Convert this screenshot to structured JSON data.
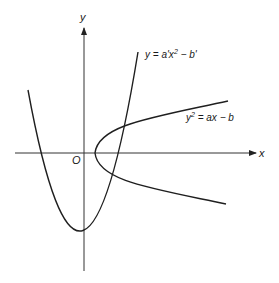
{
  "diagram": {
    "type": "coordinate-plot",
    "axes": {
      "x_label": "x",
      "y_label": "y",
      "origin_label": "O"
    },
    "curves": [
      {
        "name": "upward-parabola",
        "equation": "y = a'x² − b'",
        "label_parts": {
          "lhs": "y",
          "eq": " = a'x",
          "sup": "2",
          "rest": " − b'"
        }
      },
      {
        "name": "sideways-parabola",
        "equation": "y² = ax − b",
        "label_parts": {
          "lhs": "y",
          "sup": "2",
          "rest": " = ax − b"
        }
      }
    ],
    "colors": {
      "stroke": "#1f1f1f",
      "background": "#ffffff"
    }
  }
}
